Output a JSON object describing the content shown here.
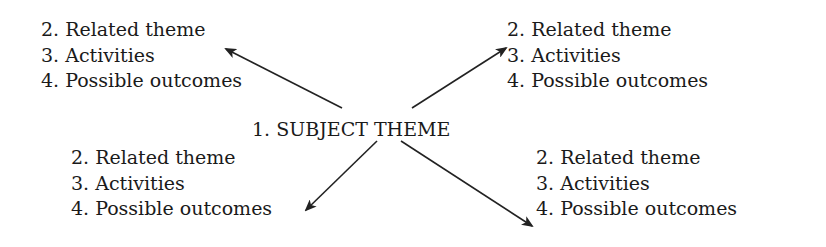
{
  "center": {
    "label": "1. SUBJECT THEME"
  },
  "blocks": {
    "top_left": {
      "items": [
        "2. Related theme",
        "3. Activities",
        "4. Possible outcomes"
      ]
    },
    "top_right": {
      "items": [
        "2. Related theme",
        "3. Activities",
        "4. Possible outcomes"
      ]
    },
    "bottom_left": {
      "items": [
        "2. Related theme",
        "3. Activities",
        "4. Possible outcomes"
      ]
    },
    "bottom_right": {
      "items": [
        "2. Related theme",
        "3. Activities",
        "4. Possible outcomes"
      ]
    }
  },
  "arrow_color": "#222222"
}
